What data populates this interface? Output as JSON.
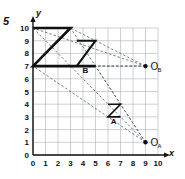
{
  "problem": {
    "number": "5"
  },
  "axes": {
    "x_label": "x",
    "y_label": "y",
    "x_ticks": [
      "0",
      "1",
      "2",
      "3",
      "4",
      "5",
      "6",
      "7",
      "8",
      "9",
      "10"
    ],
    "y_ticks": [
      "0",
      "1",
      "2",
      "3",
      "4",
      "5",
      "6",
      "7",
      "8",
      "9",
      "10"
    ],
    "x_range": [
      0,
      10
    ],
    "y_range": [
      0,
      10
    ],
    "grid": "on"
  },
  "chart_data": {
    "type": "scatter",
    "title": "",
    "xlabel": "x",
    "ylabel": "y",
    "xlim": [
      0,
      10
    ],
    "ylim": [
      0,
      10
    ],
    "grid": true,
    "legend": "none",
    "centers": [
      {
        "name": "O_A",
        "label": "O",
        "subscript": "A",
        "x": 9,
        "y": 1
      },
      {
        "name": "O_B",
        "label": "O",
        "subscript": "B",
        "x": 9,
        "y": 7
      }
    ],
    "shapes": [
      {
        "name": "large-z",
        "label": "",
        "vertices": [
          [
            0,
            10
          ],
          [
            3,
            10
          ],
          [
            0,
            7
          ],
          [
            5,
            7
          ]
        ]
      },
      {
        "name": "medium-z-b",
        "label": "B",
        "label_x": 4.2,
        "label_y": 6.45,
        "vertices": [
          [
            3.5,
            9
          ],
          [
            5,
            9
          ],
          [
            3.5,
            7
          ],
          [
            5,
            7
          ]
        ]
      },
      {
        "name": "small-z-a",
        "label": "A",
        "label_x": 6.45,
        "label_y": 2.45,
        "vertices": [
          [
            6,
            4
          ],
          [
            7,
            4
          ],
          [
            6,
            3
          ],
          [
            7,
            3
          ]
        ]
      }
    ],
    "dashed_rays": [
      {
        "from": "O_B",
        "to": [
          0,
          10
        ]
      },
      {
        "from": "O_B",
        "to": [
          3,
          10
        ]
      },
      {
        "from": "O_B",
        "to": [
          0,
          7
        ]
      },
      {
        "from": "O_B",
        "to": [
          5,
          7
        ]
      },
      {
        "from": "O_A",
        "to": [
          0,
          10
        ]
      },
      {
        "from": "O_A",
        "to": [
          3,
          10
        ]
      },
      {
        "from": "O_A",
        "to": [
          0,
          7
        ]
      },
      {
        "from": "O_A",
        "to": [
          5,
          7
        ]
      }
    ]
  },
  "colors": {
    "grid": "#b8bcc4",
    "axis": "#111111",
    "shape": "#111111",
    "dashed": "#5a5f66"
  }
}
